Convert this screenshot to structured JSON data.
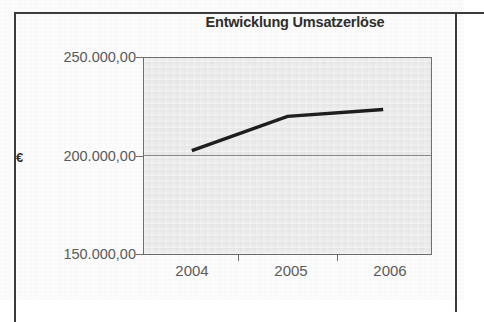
{
  "chart_data": {
    "type": "line",
    "title": "Entwicklung Umsatzerlöse",
    "xlabel": "",
    "ylabel": "€",
    "categories": [
      "2004",
      "2005",
      "2006"
    ],
    "values": [
      202700,
      220200,
      223700
    ],
    "series": [
      {
        "name": "Umsatzerlöse",
        "values": [
          202700,
          220200,
          223700
        ]
      }
    ],
    "ylim": [
      150000,
      250000
    ],
    "ytick_labels": [
      "250.000,00",
      "200.000,00",
      "150.000,00"
    ],
    "ytick_values": [
      250000,
      200000,
      150000
    ],
    "xtick_labels": [
      "2004",
      "2005",
      "2006"
    ],
    "grid": true,
    "gridlines_y": [
      200000
    ],
    "legend": false,
    "legend_position": "none",
    "line_color": "#1e1e1e",
    "plot_background": "#e9e9e9",
    "axis_color": "#6d6d6d",
    "text_color": "#5a5a5a"
  },
  "axis": {
    "unit_label": "€"
  },
  "page": {
    "border_color": "#3b3b3b",
    "background": "#fdfdfd"
  }
}
